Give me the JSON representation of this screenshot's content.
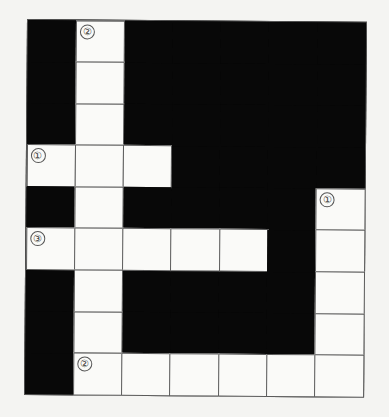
{
  "puzzle": {
    "type": "crossword",
    "cols": 7,
    "rows": 9,
    "colors": {
      "block": "#080808",
      "cell": "#fafaf8",
      "line": "#5a5a5a",
      "background": "#f4f4f2"
    },
    "grid": [
      "BWBBBBB",
      "BWBBBBB",
      "BWBBBBB",
      "WWWBBBB",
      "BWBBBBW",
      "WWWWWBW",
      "BWBBBBW",
      "BWBBBBW",
      "BWWWWWW"
    ],
    "numbers": [
      {
        "row": 0,
        "col": 1,
        "label": "②"
      },
      {
        "row": 3,
        "col": 0,
        "label": "①"
      },
      {
        "row": 4,
        "col": 6,
        "label": "①"
      },
      {
        "row": 5,
        "col": 0,
        "label": "③"
      },
      {
        "row": 8,
        "col": 1,
        "label": "②"
      }
    ]
  }
}
